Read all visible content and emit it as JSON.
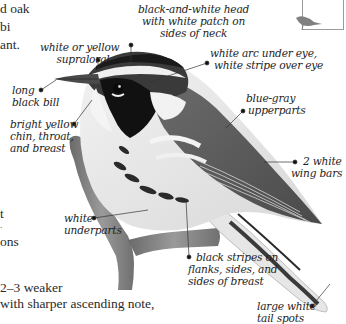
{
  "page": {
    "kind": "field-guide species illustration (grayscale)",
    "body_text_fragments": [
      {
        "text": "d oak",
        "x": 0,
        "y": 2
      },
      {
        "text": "bi",
        "x": 0,
        "y": 20
      },
      {
        "text": "ant.",
        "x": 0,
        "y": 38
      },
      {
        "text": "t",
        "x": 0,
        "y": 210
      },
      {
        "text": ".",
        "x": 0,
        "y": 224
      },
      {
        "text": "ons",
        "x": 0,
        "y": 238
      },
      {
        "text": "2–3 weaker",
        "x": 0,
        "y": 282
      },
      {
        "text": "with sharper ascending note,",
        "x": 0,
        "y": 298
      },
      {
        "text": "the fall ... at high ... ",
        "x": 0,
        "y": 314
      }
    ],
    "thumbnail": {
      "icon": "bird-silhouette-icon",
      "color": "#808080"
    }
  },
  "annotations": {
    "head": {
      "lines": [
        "black-and-white head",
        "with white patch on",
        "sides of neck"
      ]
    },
    "supraloral": {
      "lines": [
        "white or yellow",
        "supraloral"
      ]
    },
    "eye": {
      "lines": [
        "white arc under eye,",
        "white stripe over eye"
      ]
    },
    "bill": {
      "lines": [
        "long",
        "black bill"
      ]
    },
    "throat": {
      "lines": [
        "bright yellow",
        "chin, throat,",
        "and breast"
      ]
    },
    "upperparts": {
      "lines": [
        "blue-gray",
        "upperparts"
      ]
    },
    "wingbars": {
      "lines": [
        "2 white",
        "wing bars"
      ]
    },
    "underparts": {
      "lines": [
        "white",
        "underparts"
      ]
    },
    "stripes": {
      "lines": [
        "black stripes on",
        "flanks, sides, and",
        "sides of breast"
      ]
    },
    "tail": {
      "lines": [
        "large white",
        "tail spots"
      ]
    }
  },
  "colors": {
    "ink": "#1e1e1e",
    "leader": "#333333",
    "bird_dark": "#1a1a1a",
    "bird_mid": "#8a8a8a",
    "bird_light": "#e8e8e8",
    "branch": "#7a7a7a",
    "frame": "#9a9a9a"
  }
}
